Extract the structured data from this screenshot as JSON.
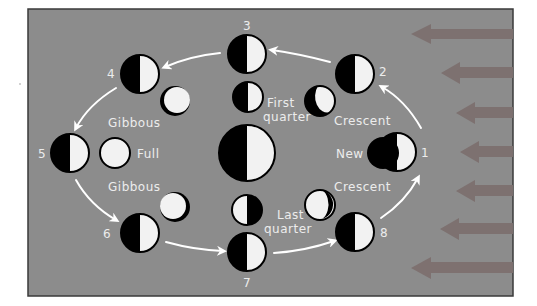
{
  "figure": {
    "colors": {
      "background": "#8c8c8c",
      "frame_border": "#3a3a3a",
      "moon_dark": "#000000",
      "moon_light": "#f2f2f2",
      "text": "#ececec",
      "orbit_arrow": "#ffffff",
      "sunlight_arrow": "#7a7070"
    },
    "orbit_positions": [
      {
        "number": "1",
        "x": 397,
        "y": 152
      },
      {
        "number": "2",
        "x": 355,
        "y": 74
      },
      {
        "number": "3",
        "x": 247,
        "y": 54
      },
      {
        "number": "4",
        "x": 140,
        "y": 74
      },
      {
        "number": "5",
        "x": 70,
        "y": 153
      },
      {
        "number": "6",
        "x": 140,
        "y": 233
      },
      {
        "number": "7",
        "x": 247,
        "y": 252
      },
      {
        "number": "8",
        "x": 355,
        "y": 232
      }
    ],
    "phase_labels": {
      "new": "New",
      "crescent_waxing": "Crescent",
      "first_quarter_line1": "First",
      "first_quarter_line2": "quarter",
      "gibbous_waxing": "Gibbous",
      "full": "Full",
      "gibbous_waning": "Gibbous",
      "last_quarter_line1": "Last",
      "last_quarter_line2": "quarter",
      "crescent_waning": "Crescent"
    },
    "center_body": "Earth",
    "sunlight_arrow_count": 7
  }
}
